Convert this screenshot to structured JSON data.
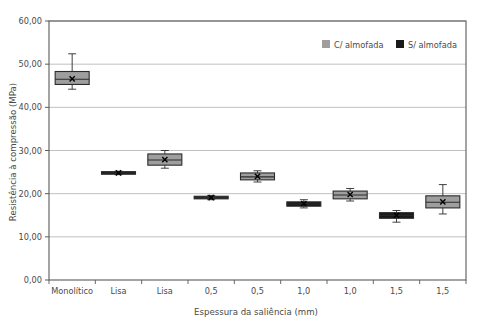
{
  "chart_data": {
    "type": "box",
    "title": "",
    "xlabel": "Espessura da saliência (mm)",
    "ylabel": "Resistência à compressão (MPa)",
    "ylim": [
      0,
      60
    ],
    "ytick_step": 10,
    "ytick_labels": [
      "0,00",
      "10,00",
      "20,00",
      "30,00",
      "40,00",
      "50,00",
      "60,00"
    ],
    "ytick_values": [
      0,
      10,
      20,
      30,
      40,
      50,
      60
    ],
    "grid": true,
    "grid_axis": "y",
    "legend_position": "top-right",
    "categories": [
      "Monolítico",
      "Lisa",
      "Lisa",
      "0,5",
      "0,5",
      "1,0",
      "1,0",
      "1,5",
      "1,5"
    ],
    "legend": [
      {
        "name": "C/ almofada",
        "color": "#9e9e9e"
      },
      {
        "name": "S/ almofada",
        "color": "#1a1a1a"
      }
    ],
    "boxes": [
      {
        "category": "Monolítico",
        "series": "C/ almofada",
        "whisker_low": 44.2,
        "q1": 45.3,
        "median": 46.5,
        "mean": 46.6,
        "q3": 48.3,
        "whisker_high": 52.4
      },
      {
        "category": "Lisa",
        "series": "S/ almofada",
        "whisker_low": 24.4,
        "q1": 24.5,
        "median": 24.8,
        "mean": 24.8,
        "q3": 25.1,
        "whisker_high": 25.2
      },
      {
        "category": "Lisa",
        "series": "C/ almofada",
        "whisker_low": 25.9,
        "q1": 26.6,
        "median": 27.8,
        "mean": 27.9,
        "q3": 29.2,
        "whisker_high": 30.0
      },
      {
        "category": "0,5",
        "series": "S/ almofada",
        "whisker_low": 18.6,
        "q1": 18.8,
        "median": 19.1,
        "mean": 19.1,
        "q3": 19.4,
        "whisker_high": 19.6
      },
      {
        "category": "0,5",
        "series": "C/ almofada",
        "whisker_low": 22.7,
        "q1": 23.2,
        "median": 23.9,
        "mean": 24.0,
        "q3": 24.8,
        "whisker_high": 25.3
      },
      {
        "category": "1,0",
        "series": "S/ almofada",
        "whisker_low": 16.7,
        "q1": 17.1,
        "median": 17.6,
        "mean": 17.7,
        "q3": 18.1,
        "whisker_high": 18.6
      },
      {
        "category": "1,0",
        "series": "C/ almofada",
        "whisker_low": 18.3,
        "q1": 18.8,
        "median": 19.7,
        "mean": 19.8,
        "q3": 20.6,
        "whisker_high": 21.2
      },
      {
        "category": "1,5",
        "series": "S/ almofada",
        "whisker_low": 13.4,
        "q1": 14.3,
        "median": 15.0,
        "mean": 15.0,
        "q3": 15.6,
        "whisker_high": 16.1
      },
      {
        "category": "1,5",
        "series": "C/ almofada",
        "whisker_low": 15.3,
        "q1": 16.7,
        "median": 18.0,
        "mean": 18.1,
        "q3": 19.5,
        "whisker_high": 22.1
      }
    ]
  },
  "colors": {
    "gray_fill": "#9e9e9e",
    "black_fill": "#1a1a1a",
    "border": "#2b2b2b",
    "gridline": "#b9b9b9",
    "axis": "#5a5a5a",
    "text": "#4a4a4a",
    "background": "#ffffff"
  }
}
